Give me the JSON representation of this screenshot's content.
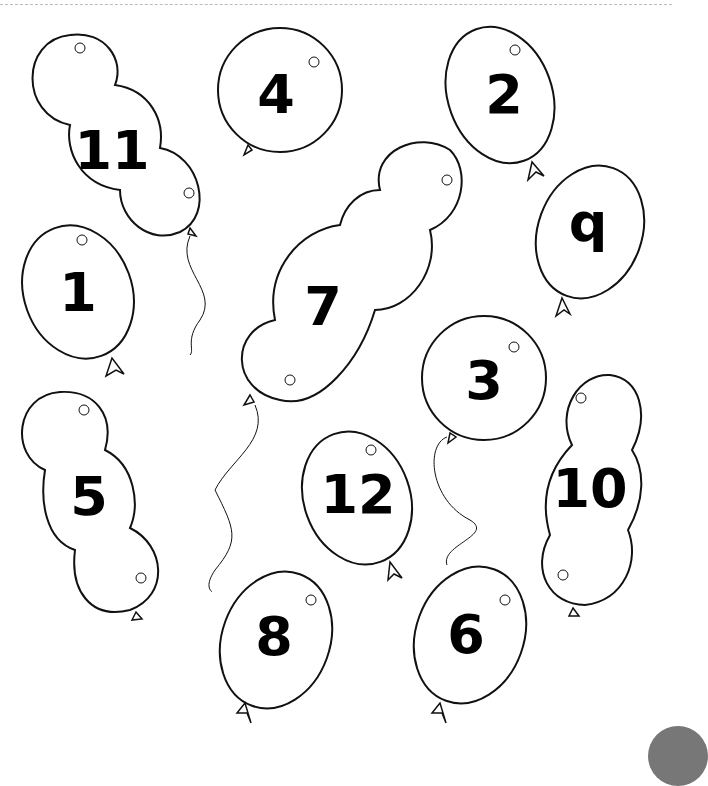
{
  "worksheet": {
    "balloons": [
      {
        "id": "b11",
        "label": "11",
        "shape": "triple"
      },
      {
        "id": "b4",
        "label": "4",
        "shape": "round"
      },
      {
        "id": "b2",
        "label": "2",
        "shape": "oval"
      },
      {
        "id": "b9",
        "label": "q",
        "shape": "oval"
      },
      {
        "id": "b1",
        "label": "1",
        "shape": "oval"
      },
      {
        "id": "b7",
        "label": "7",
        "shape": "triple"
      },
      {
        "id": "b3",
        "label": "3",
        "shape": "round"
      },
      {
        "id": "b5",
        "label": "5",
        "shape": "triple"
      },
      {
        "id": "b12",
        "label": "12",
        "shape": "oval"
      },
      {
        "id": "b10",
        "label": "10",
        "shape": "triple"
      },
      {
        "id": "b8",
        "label": "8",
        "shape": "oval"
      },
      {
        "id": "b6",
        "label": "6",
        "shape": "oval"
      }
    ],
    "colors": {
      "stroke": "#111111",
      "background": "#ffffff",
      "corner": "#777777"
    }
  }
}
